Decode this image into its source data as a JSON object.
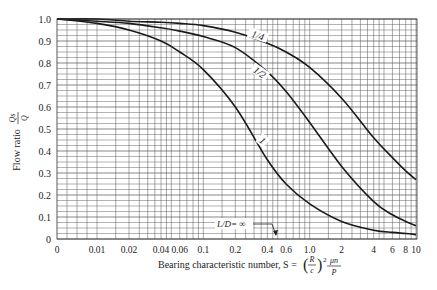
{
  "chart_data": {
    "type": "line",
    "title": "",
    "xlabel": "Bearing characteristic number, S = (R/c)² μn/P",
    "ylabel": "Flow ratio Qs/Q",
    "x_scale": "log-like (0 at origin, 0.01 to 10)",
    "ylim": [
      0,
      1.0
    ],
    "xlim": [
      0,
      10
    ],
    "grid": true,
    "x_ticks": [
      "0",
      "0.01",
      "0.02",
      "0.04",
      "0.06",
      "0.1",
      "0.2",
      "0.4",
      "0.6",
      "1.0",
      "2",
      "4",
      "6",
      "8",
      "10"
    ],
    "y_ticks": [
      "0",
      "0.1",
      "0.2",
      "0.3",
      "0.4",
      "0.5",
      "0.6",
      "0.7",
      "0.8",
      "0.9",
      "1.0"
    ],
    "series": [
      {
        "name": "1/4",
        "x": [
          0,
          0.01,
          0.02,
          0.04,
          0.06,
          0.1,
          0.2,
          0.4,
          0.6,
          1.0,
          2,
          4,
          6,
          8,
          10
        ],
        "values": [
          1.0,
          1.0,
          0.99,
          0.985,
          0.98,
          0.97,
          0.94,
          0.89,
          0.85,
          0.78,
          0.64,
          0.46,
          0.37,
          0.31,
          0.27
        ]
      },
      {
        "name": "1/2",
        "x": [
          0,
          0.01,
          0.02,
          0.04,
          0.06,
          0.1,
          0.2,
          0.4,
          0.6,
          1.0,
          2,
          4,
          6,
          8,
          10
        ],
        "values": [
          1.0,
          0.99,
          0.98,
          0.96,
          0.945,
          0.92,
          0.87,
          0.76,
          0.67,
          0.53,
          0.33,
          0.17,
          0.11,
          0.08,
          0.06
        ]
      },
      {
        "name": "1",
        "x": [
          0,
          0.01,
          0.02,
          0.04,
          0.06,
          0.1,
          0.2,
          0.4,
          0.6,
          1.0,
          2,
          4,
          6,
          8,
          10
        ],
        "values": [
          1.0,
          0.98,
          0.95,
          0.9,
          0.85,
          0.77,
          0.6,
          0.36,
          0.25,
          0.16,
          0.08,
          0.04,
          0.03,
          0.025,
          0.02
        ]
      },
      {
        "name": "L/D = ∞",
        "x": [
          0,
          10
        ],
        "values": [
          0,
          0
        ]
      }
    ],
    "annotations": [
      "1/4",
      "1/2",
      "1",
      "L/D = ∞"
    ]
  },
  "labels": {
    "ylabel_main": "Flow ratio",
    "ylabel_num": "Qs",
    "ylabel_den": "Q",
    "xlabel_main": "Bearing characteristic number, S = ",
    "xlabel_frac_num": "R",
    "xlabel_frac_den": "c",
    "xlabel_tail_num": "μn",
    "xlabel_tail_den": "P",
    "curve_quarter": "1/4",
    "curve_half": "1/2",
    "curve_one": "1",
    "curve_inf": "L/D= ∞"
  }
}
